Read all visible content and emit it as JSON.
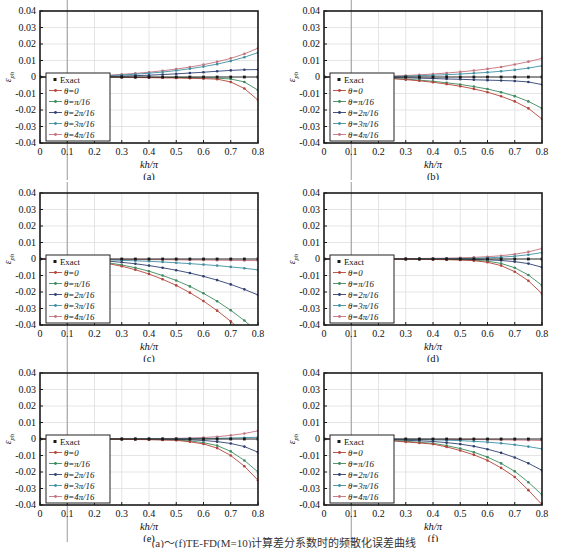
{
  "figure": {
    "caption": "(a)～(f)TE-FD(M=10)计算差分系数时的频散化误差曲线",
    "xlabel": "kh/π",
    "ylabel": {
      "base": "ε",
      "sub": "ph"
    },
    "xlim": [
      0,
      0.8
    ],
    "ylim": [
      -0.04,
      0.04
    ],
    "grid_on": true,
    "x_tick_labels": [
      "0",
      "0.1",
      "0.2",
      "0.3",
      "0.4",
      "0.5",
      "0.6",
      "0.7",
      "0.8"
    ],
    "y_tick_labels": [
      "0.04",
      "0.03",
      "0.02",
      "0.01",
      "0",
      "-0.01",
      "-0.02",
      "-0.03",
      "-0.04"
    ],
    "legend_position": "lower-left-inside",
    "legend": [
      {
        "name": "Exact",
        "color": "#1a1a1a",
        "marker": "square"
      },
      {
        "name": "θ=0",
        "color": "#b5433a",
        "marker": "dot"
      },
      {
        "name": "θ=π/16",
        "color": "#3c8a5d",
        "marker": "dot"
      },
      {
        "name": "θ=2π/16",
        "color": "#2f3f70",
        "marker": "dot"
      },
      {
        "name": "θ=3π/16",
        "color": "#4090a3",
        "marker": "dot"
      },
      {
        "name": "θ=4π/16",
        "color": "#c4737e",
        "marker": "dot"
      }
    ],
    "x_points": [
      0,
      0.05,
      0.1,
      0.15,
      0.2,
      0.25,
      0.3,
      0.35,
      0.4,
      0.45,
      0.5,
      0.55,
      0.6,
      0.65,
      0.7,
      0.75,
      0.8
    ]
  },
  "chart_data": [
    {
      "type": "line",
      "label": "(a)",
      "series": [
        {
          "name": "Exact",
          "values": [
            0,
            0,
            0,
            0,
            0,
            0,
            0,
            0,
            0,
            0,
            0,
            0,
            0,
            0,
            0,
            0,
            0
          ]
        },
        {
          "name": "θ=0",
          "values": [
            0,
            0,
            0,
            0,
            0,
            -0.0001,
            -0.0002,
            -0.0003,
            -0.0004,
            -0.0005,
            -0.0006,
            -0.0008,
            -0.001,
            -0.0013,
            -0.003,
            -0.007,
            -0.014
          ]
        },
        {
          "name": "θ=π/16",
          "values": [
            0,
            0,
            0,
            0,
            0,
            0,
            -0.0001,
            -0.0002,
            -0.0002,
            -0.0003,
            -0.0003,
            -0.0004,
            -0.0005,
            -0.0007,
            -0.0012,
            -0.003,
            -0.008
          ]
        },
        {
          "name": "θ=2π/16",
          "values": [
            0,
            0,
            0,
            0.0001,
            0.0002,
            0.0003,
            0.0005,
            0.0008,
            0.0011,
            0.0015,
            0.0019,
            0.0024,
            0.0029,
            0.0035,
            0.004,
            0.0044,
            0.0045
          ]
        },
        {
          "name": "θ=3π/16",
          "values": [
            0,
            0,
            0.0001,
            0.0003,
            0.0005,
            0.0008,
            0.0012,
            0.0017,
            0.0023,
            0.003,
            0.0039,
            0.005,
            0.0063,
            0.0078,
            0.0097,
            0.012,
            0.0148
          ]
        },
        {
          "name": "θ=4π/16",
          "values": [
            0,
            0,
            0.0001,
            0.0004,
            0.0007,
            0.0011,
            0.0016,
            0.0022,
            0.0029,
            0.0038,
            0.0048,
            0.006,
            0.0075,
            0.0092,
            0.0113,
            0.014,
            0.0175
          ]
        }
      ]
    },
    {
      "type": "line",
      "label": "(b)",
      "series": [
        {
          "name": "Exact",
          "values": [
            0,
            0,
            0,
            0,
            0,
            0,
            0,
            0,
            0,
            0,
            0,
            0,
            0,
            0,
            0,
            0,
            0
          ]
        },
        {
          "name": "θ=0",
          "values": [
            0,
            0,
            -0.0001,
            -0.0003,
            -0.0006,
            -0.001,
            -0.0016,
            -0.0023,
            -0.0032,
            -0.0043,
            -0.0056,
            -0.0072,
            -0.0092,
            -0.0117,
            -0.0148,
            -0.019,
            -0.0255
          ]
        },
        {
          "name": "θ=π/16",
          "values": [
            0,
            0,
            -0.0001,
            -0.0002,
            -0.0005,
            -0.0008,
            -0.0013,
            -0.0019,
            -0.0026,
            -0.0035,
            -0.0045,
            -0.0058,
            -0.0073,
            -0.0092,
            -0.0116,
            -0.0148,
            -0.019
          ]
        },
        {
          "name": "θ=2π/16",
          "values": [
            0,
            0,
            0,
            -0.0001,
            -0.0002,
            -0.0003,
            -0.0005,
            -0.0007,
            -0.0009,
            -0.0012,
            -0.0014,
            -0.0017,
            -0.0019,
            -0.0021,
            -0.0024,
            -0.003,
            -0.0046
          ]
        },
        {
          "name": "θ=3π/16",
          "values": [
            0,
            0,
            0,
            0.0001,
            0.0002,
            0.0003,
            0.0005,
            0.0008,
            0.0011,
            0.0014,
            0.0018,
            0.0023,
            0.0028,
            0.0035,
            0.0043,
            0.0054,
            0.0068
          ]
        },
        {
          "name": "θ=4π/16",
          "values": [
            0,
            0,
            0.0001,
            0.0002,
            0.0004,
            0.0006,
            0.0009,
            0.0013,
            0.0018,
            0.0024,
            0.0031,
            0.0039,
            0.0049,
            0.0061,
            0.0076,
            0.0093,
            0.0113
          ]
        }
      ]
    },
    {
      "type": "line",
      "label": "(c)",
      "series": [
        {
          "name": "Exact",
          "values": [
            0,
            0,
            0,
            0,
            0,
            0,
            0,
            0,
            0,
            0,
            0,
            0,
            0,
            0,
            0,
            0,
            0
          ]
        },
        {
          "name": "θ=0",
          "values": [
            0,
            -0.0001,
            -0.0003,
            -0.0008,
            -0.0016,
            -0.0028,
            -0.0044,
            -0.0065,
            -0.0091,
            -0.0123,
            -0.016,
            -0.0204,
            -0.0255,
            -0.0313,
            -0.0378,
            -0.0451,
            -0.0532
          ]
        },
        {
          "name": "θ=π/16",
          "values": [
            0,
            -0.0001,
            -0.0003,
            -0.0007,
            -0.0013,
            -0.0023,
            -0.0036,
            -0.0053,
            -0.0074,
            -0.01,
            -0.013,
            -0.0166,
            -0.0208,
            -0.0256,
            -0.0311,
            -0.0373,
            -0.0443
          ]
        },
        {
          "name": "θ=2π/16",
          "values": [
            0,
            0,
            -0.0002,
            -0.0004,
            -0.0008,
            -0.0013,
            -0.002,
            -0.0029,
            -0.004,
            -0.0053,
            -0.0068,
            -0.0085,
            -0.0105,
            -0.0128,
            -0.0154,
            -0.0184,
            -0.0218
          ]
        },
        {
          "name": "θ=3π/16",
          "values": [
            0,
            0,
            -0.0001,
            -0.0002,
            -0.0003,
            -0.0005,
            -0.0008,
            -0.0011,
            -0.0014,
            -0.0018,
            -0.0023,
            -0.0028,
            -0.0034,
            -0.004,
            -0.0048,
            -0.0056,
            -0.0066
          ]
        },
        {
          "name": "θ=4π/16",
          "values": [
            0,
            0,
            0,
            -0.0001,
            -0.0001,
            -0.0002,
            -0.0002,
            -0.0003,
            -0.0004,
            -0.0004,
            -0.0005,
            -0.0006,
            -0.0006,
            -0.0007,
            -0.0008,
            -0.0009,
            -0.001
          ]
        }
      ]
    },
    {
      "type": "line",
      "label": "(d)",
      "series": [
        {
          "name": "Exact",
          "values": [
            0,
            0,
            0,
            0,
            0,
            0,
            0,
            0,
            0,
            0,
            0,
            0,
            0,
            0,
            0,
            0,
            0
          ]
        },
        {
          "name": "θ=0",
          "values": [
            0,
            0,
            0,
            0,
            0,
            -0.0001,
            -0.0001,
            -0.0002,
            -0.0003,
            -0.0004,
            -0.0006,
            -0.001,
            -0.002,
            -0.004,
            -0.0077,
            -0.0132,
            -0.021
          ]
        },
        {
          "name": "θ=π/16",
          "values": [
            0,
            0,
            0,
            0,
            0,
            0,
            -0.0001,
            -0.0001,
            -0.0002,
            -0.0003,
            -0.0004,
            -0.0007,
            -0.0013,
            -0.0027,
            -0.0053,
            -0.0097,
            -0.016
          ]
        },
        {
          "name": "θ=2π/16",
          "values": [
            0,
            0,
            0,
            0,
            0,
            0,
            0,
            0,
            -0.0001,
            -0.0001,
            -0.0002,
            -0.0003,
            -0.0005,
            -0.0009,
            -0.0016,
            -0.0028,
            -0.005
          ]
        },
        {
          "name": "θ=3π/16",
          "values": [
            0,
            0,
            0,
            0,
            0,
            0,
            0,
            0.0001,
            0.0001,
            0.0002,
            0.0003,
            0.0004,
            0.0007,
            0.0011,
            0.0017,
            0.0026,
            0.0039
          ]
        },
        {
          "name": "θ=4π/16",
          "values": [
            0,
            0,
            0,
            0,
            0.0001,
            0.0001,
            0.0002,
            0.0003,
            0.0004,
            0.0005,
            0.0007,
            0.001,
            0.0014,
            0.002,
            0.0029,
            0.0043,
            0.0064
          ]
        }
      ]
    },
    {
      "type": "line",
      "label": "(e)",
      "series": [
        {
          "name": "Exact",
          "values": [
            0,
            0,
            0,
            0,
            0,
            0,
            0,
            0,
            0,
            0,
            0,
            0,
            0,
            0,
            0,
            0,
            0
          ]
        },
        {
          "name": "θ=0",
          "values": [
            0,
            0,
            0,
            0,
            -0.0001,
            -0.0001,
            -0.0002,
            -0.0003,
            -0.0004,
            -0.0006,
            -0.0008,
            -0.0017,
            -0.003,
            -0.0055,
            -0.01,
            -0.0165,
            -0.025
          ]
        },
        {
          "name": "θ=π/16",
          "values": [
            0,
            0,
            0,
            0,
            0,
            -0.0001,
            -0.0001,
            -0.0002,
            -0.0003,
            -0.0004,
            -0.0006,
            -0.0012,
            -0.0022,
            -0.004,
            -0.0075,
            -0.013,
            -0.02
          ]
        },
        {
          "name": "θ=2π/16",
          "values": [
            0,
            0,
            0,
            0,
            0,
            0,
            -0.0001,
            -0.0001,
            -0.0001,
            -0.0002,
            -0.0003,
            -0.0005,
            -0.0009,
            -0.0016,
            -0.0027,
            -0.0046,
            -0.008
          ]
        },
        {
          "name": "θ=3π/16",
          "values": [
            0,
            0,
            0,
            0,
            0,
            0,
            0,
            0,
            0.0001,
            0.0001,
            0.0001,
            0.0002,
            0.0003,
            0.0004,
            0.0006,
            0.0008,
            0.0011
          ]
        },
        {
          "name": "θ=4π/16",
          "values": [
            0,
            0,
            0,
            0,
            0,
            0.0001,
            0.0001,
            0.0002,
            0.0002,
            0.0003,
            0.0004,
            0.0006,
            0.0009,
            0.0014,
            0.0022,
            0.0033,
            0.005
          ]
        }
      ]
    },
    {
      "type": "line",
      "label": "(f)",
      "series": [
        {
          "name": "Exact",
          "values": [
            0,
            0,
            0,
            0,
            0,
            0,
            0,
            0,
            0,
            0,
            0,
            0,
            0,
            0,
            0,
            0,
            0
          ]
        },
        {
          "name": "θ=0",
          "values": [
            0,
            0,
            -0.0001,
            -0.0003,
            -0.0006,
            -0.0011,
            -0.0018,
            -0.0024,
            -0.0031,
            -0.0048,
            -0.007,
            -0.0096,
            -0.013,
            -0.0175,
            -0.023,
            -0.031,
            -0.0398
          ]
        },
        {
          "name": "θ=π/16",
          "values": [
            0,
            0,
            -0.0001,
            -0.0002,
            -0.0005,
            -0.0009,
            -0.0014,
            -0.002,
            -0.0026,
            -0.004,
            -0.0058,
            -0.008,
            -0.011,
            -0.0148,
            -0.0196,
            -0.0262,
            -0.0338
          ]
        },
        {
          "name": "θ=2π/16",
          "values": [
            0,
            0,
            0,
            -0.0001,
            -0.0003,
            -0.0005,
            -0.0008,
            -0.0011,
            -0.0015,
            -0.0022,
            -0.0031,
            -0.0044,
            -0.0062,
            -0.0084,
            -0.0112,
            -0.0147,
            -0.019
          ]
        },
        {
          "name": "θ=3π/16",
          "values": [
            0,
            0,
            0,
            0,
            -0.0001,
            -0.0002,
            -0.0003,
            -0.0004,
            -0.0005,
            -0.0007,
            -0.001,
            -0.0014,
            -0.0019,
            -0.0026,
            -0.0035,
            -0.0046,
            -0.006
          ]
        },
        {
          "name": "θ=4π/16",
          "values": [
            0,
            0,
            0,
            0,
            0,
            -0.0001,
            -0.0001,
            -0.0001,
            -0.0002,
            -0.0002,
            -0.0003,
            -0.0003,
            -0.0004,
            -0.0005,
            -0.0006,
            -0.0007,
            -0.0009
          ]
        }
      ]
    }
  ]
}
